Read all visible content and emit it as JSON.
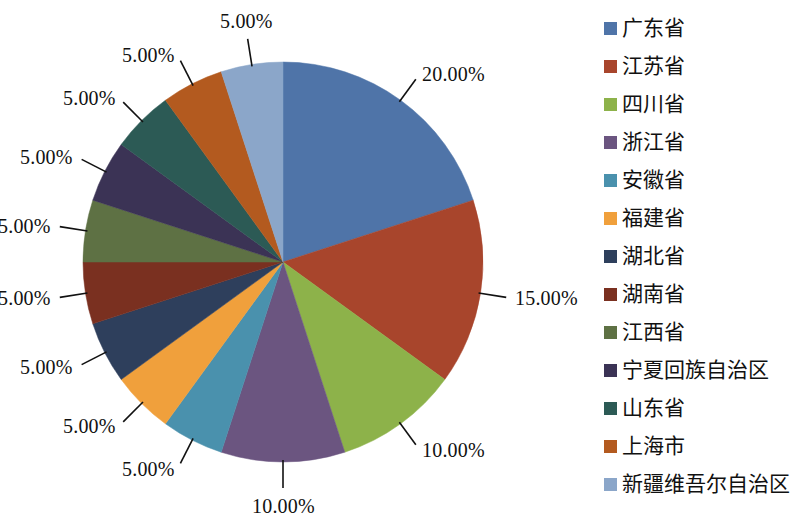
{
  "chart_data": {
    "type": "pie",
    "title": "",
    "xlabel": "",
    "ylabel": "",
    "legend_position": "right",
    "start_angle_deg": 0,
    "direction": "clockwise",
    "label_format": "percent-2dp",
    "categories": [
      "广东省",
      "江苏省",
      "四川省",
      "浙江省",
      "安徽省",
      "福建省",
      "湖北省",
      "湖南省",
      "江西省",
      "宁夏回族自治区",
      "山东省",
      "上海市",
      "新疆维吾尔自治区"
    ],
    "values": [
      20,
      15,
      10,
      10,
      5,
      5,
      5,
      5,
      5,
      5,
      5,
      5,
      5
    ],
    "data_labels": [
      "20.00%",
      "15.00%",
      "10.00%",
      "10.00%",
      "5.00%",
      "5.00%",
      "5.00%",
      "5.00%",
      "5.00%",
      "5.00%",
      "5.00%",
      "5.00%",
      "5.00%"
    ],
    "colors": [
      "#4f74a8",
      "#a8452c",
      "#8db24a",
      "#6b5580",
      "#4a91ad",
      "#f0a03c",
      "#2e3f5c",
      "#7a3020",
      "#5e7144",
      "#3b3355",
      "#2c5a55",
      "#b35a1f",
      "#8ba6c9"
    ]
  },
  "legend": {
    "items": [
      {
        "label": "广东省",
        "color": "#4f74a8"
      },
      {
        "label": "江苏省",
        "color": "#a8452c"
      },
      {
        "label": "四川省",
        "color": "#8db24a"
      },
      {
        "label": "浙江省",
        "color": "#6b5580"
      },
      {
        "label": "安徽省",
        "color": "#4a91ad"
      },
      {
        "label": "福建省",
        "color": "#f0a03c"
      },
      {
        "label": "湖北省",
        "color": "#2e3f5c"
      },
      {
        "label": "湖南省",
        "color": "#7a3020"
      },
      {
        "label": "江西省",
        "color": "#5e7144"
      },
      {
        "label": "宁夏回族自治区",
        "color": "#3b3355"
      },
      {
        "label": "山东省",
        "color": "#2c5a55"
      },
      {
        "label": "上海市",
        "color": "#b35a1f"
      },
      {
        "label": "新疆维吾尔自治区",
        "color": "#8ba6c9"
      }
    ]
  },
  "geometry": {
    "center_x": 283,
    "center_y": 262,
    "radius": 200
  }
}
